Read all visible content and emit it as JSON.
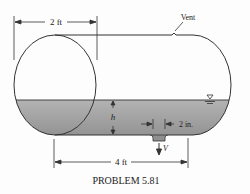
{
  "figure": {
    "caption": "PROBLEM 5.81",
    "labels": {
      "diameter": "2 ft",
      "length": "4 ft",
      "vent": "Vent",
      "depth": "h",
      "drain_diameter": "2 in.",
      "velocity": "V"
    },
    "colors": {
      "liquid": "#a9a9a9",
      "liquid_dark": "#8e8e8e",
      "outline": "#333333",
      "background": "#fdfdfd"
    }
  }
}
